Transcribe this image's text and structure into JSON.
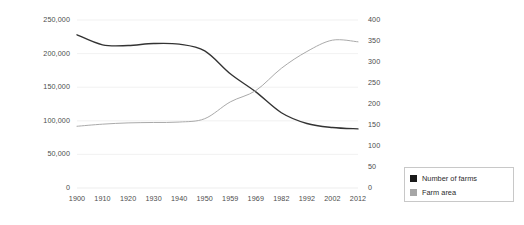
{
  "chart_data": {
    "type": "line",
    "title": "",
    "subtitle": "",
    "xlabel": "",
    "ylabel": "",
    "grid": true,
    "legend_position": "right-bottom",
    "x": [
      "1900",
      "1910",
      "1920",
      "1930",
      "1940",
      "1950",
      "1959",
      "1969",
      "1982",
      "1992",
      "2002",
      "2012"
    ],
    "categories": [
      "1900",
      "1910",
      "1920",
      "1930",
      "1940",
      "1950",
      "1959",
      "1969",
      "1982",
      "1992",
      "2002",
      "2012"
    ],
    "axes": {
      "left": {
        "label": "",
        "ylim": [
          0,
          250000
        ],
        "ticks": [
          0,
          50000,
          100000,
          150000,
          200000,
          250000
        ],
        "tick_labels": [
          "0",
          "50,000",
          "100,000",
          "150,000",
          "200,000",
          "250,000"
        ]
      },
      "right": {
        "label": "",
        "ylim": [
          0,
          400
        ],
        "ticks": [
          0,
          50,
          100,
          150,
          200,
          250,
          300,
          350,
          400
        ],
        "tick_labels": [
          "0",
          "50",
          "100",
          "150",
          "200",
          "250",
          "300",
          "350",
          "400"
        ]
      }
    },
    "series": [
      {
        "name": "Number of farms",
        "axis": "left",
        "color": "#333333",
        "values": [
          228000,
          213000,
          212000,
          215000,
          214000,
          204000,
          170000,
          143000,
          112000,
          96000,
          90000,
          88000
        ]
      },
      {
        "name": "Farm area",
        "axis": "right",
        "color": "#aaaaaa",
        "values": [
          147,
          152,
          155,
          156,
          157,
          165,
          205,
          232,
          285,
          325,
          352,
          348
        ]
      }
    ]
  },
  "legend": {
    "items": [
      {
        "label": "Number of farms",
        "swatch": "#1a1a1a"
      },
      {
        "label": "Farm area",
        "swatch": "#a6a6a6"
      }
    ]
  },
  "colors": {
    "number_of_farms": "#333333",
    "farm_area": "#aaaaaa",
    "gridline": "#ededed",
    "axis_text": "#4c4c4c",
    "legend_border": "#c8c8c8",
    "background": "#ffffff"
  }
}
